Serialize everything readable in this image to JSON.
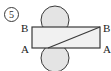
{
  "figure": {
    "problem_number": "5",
    "labels": {
      "top_left": "B",
      "bottom_left": "A",
      "top_right": "B",
      "bottom_right": "A"
    },
    "colors": {
      "stroke": "#3a3a3a",
      "rectangle_fill": "#f2f2f2",
      "circle_fill": "#e2e2e2",
      "background": "#ffffff",
      "text": "#1a1a1a"
    },
    "geometry": {
      "rectangle": {
        "x": 32,
        "y": 27,
        "width": 68,
        "height": 21
      },
      "diagonal": {
        "x1": 48,
        "y1": 48,
        "x2": 100,
        "y2": 27
      },
      "circle_top": {
        "cx": 55,
        "cy": 20,
        "r": 14
      },
      "circle_bottom": {
        "cx": 55,
        "cy": 58,
        "r": 14
      }
    }
  }
}
